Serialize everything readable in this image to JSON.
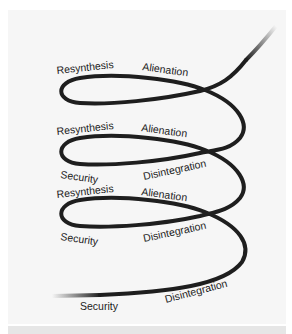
{
  "diagram": {
    "type": "spiral",
    "stroke_color": "#1e1e1e",
    "panel_color": "#f6f6f6",
    "labels": {
      "resynthesis": "Resynthesis",
      "alienation": "Alienation",
      "security": "Security",
      "disintegration": "Disintegration"
    },
    "turns": [
      {
        "top_left": "Resynthesis",
        "top_right": "Alienation"
      },
      {
        "top_left": "Resynthesis",
        "top_right": "Alienation",
        "bottom_left": "Security",
        "bottom_right": "Disintegration"
      },
      {
        "top_left": "Resynthesis",
        "top_right": "Alienation",
        "bottom_left": "Security",
        "bottom_right": "Disintegration"
      },
      {
        "bottom_left": "Security",
        "bottom_right": "Disintegration"
      }
    ]
  }
}
